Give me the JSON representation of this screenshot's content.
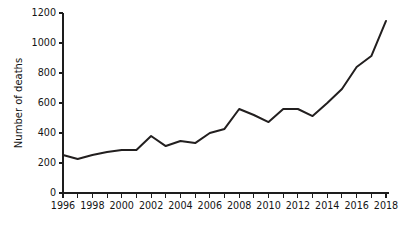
{
  "chart_data": {
    "type": "line",
    "title": "",
    "subtitle": "",
    "xlabel": "",
    "ylabel": "Number of deaths",
    "xlim": [
      1996,
      2018
    ],
    "ylim": [
      0,
      1200
    ],
    "grid": false,
    "legend": false,
    "legend_position": "none",
    "x_tick_step_major": 2,
    "x_tick_step_minor": 1,
    "y_tick_step": 200,
    "x_tick_labels": [
      "1996",
      "1998",
      "2000",
      "2002",
      "2004",
      "2006",
      "2008",
      "2010",
      "2012",
      "2014",
      "2016",
      "2018"
    ],
    "y_tick_labels": [
      "0",
      "200",
      "400",
      "600",
      "800",
      "1000",
      "1200"
    ],
    "x": [
      1996,
      1997,
      1998,
      1999,
      2000,
      2001,
      2002,
      2003,
      2004,
      2005,
      2006,
      2007,
      2008,
      2009,
      2010,
      2011,
      2012,
      2013,
      2014,
      2015,
      2016,
      2017,
      2018
    ],
    "series": [
      {
        "name": "Number of deaths",
        "color": "#221f1f",
        "values": [
          253,
          227,
          253,
          273,
          287,
          287,
          380,
          313,
          347,
          333,
          400,
          427,
          560,
          520,
          473,
          560,
          560,
          513,
          600,
          693,
          840,
          913,
          1147
        ]
      }
    ]
  },
  "axes": {
    "y_axis_title": "Number of deaths"
  }
}
